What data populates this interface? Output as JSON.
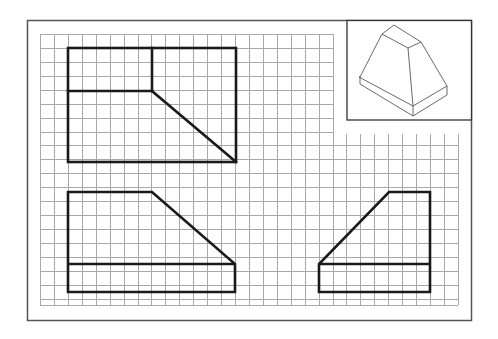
{
  "drawing": {
    "type": "orthographic-projection-exercise",
    "frame": {
      "x": 27,
      "y": 20,
      "width": 445,
      "height": 301
    },
    "grid": {
      "x0": 40,
      "y0": 34,
      "pitch": 13.93,
      "x1": 458,
      "y1": 305,
      "upper_x1": 333,
      "lower_y0": 134,
      "color": "#9a9a9a"
    },
    "iso_inset": {
      "x": 347,
      "y": 20,
      "width": 125,
      "height": 100
    },
    "line_color": "#1a1a1a",
    "views": [
      {
        "name": "top-view",
        "description": "Top view rectangle with corner notch and diagonal"
      },
      {
        "name": "front-view",
        "description": "Front view trapezoid on base slab"
      },
      {
        "name": "side-view",
        "description": "Side view mirrored trapezoid on base slab"
      }
    ]
  }
}
